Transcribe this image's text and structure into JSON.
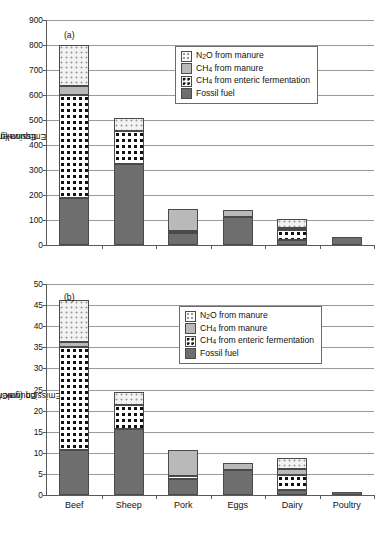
{
  "figure": {
    "panel_a_tag": "(a)",
    "panel_b_tag": "(b)",
    "caption_clipped": ""
  },
  "legend": {
    "items": [
      {
        "key": "n2o",
        "label_prefix": "N",
        "label_sub": "2",
        "label_suffix": "O from manure"
      },
      {
        "key": "manure-ch4",
        "label_prefix": "CH",
        "label_sub": "4",
        "label_suffix": " from manure"
      },
      {
        "key": "enteric",
        "label_prefix": "CH",
        "label_sub": "4",
        "label_suffix": " from enteric fermentation"
      },
      {
        "key": "fossil",
        "label_prefix": "Fossil fuel",
        "label_sub": "",
        "label_suffix": ""
      }
    ]
  },
  "chart_data": [
    {
      "type": "bar",
      "id": "panel-a",
      "title": "(a)",
      "stacked": true,
      "categories": [
        "Beef",
        "Sheep",
        "Pork",
        "Eggs",
        "Dairy",
        "Poultry"
      ],
      "series": [
        {
          "name": "Fossil fuel",
          "values": [
            190,
            325,
            48,
            112,
            20,
            33
          ]
        },
        {
          "name": "CH4 from enteric fermentation",
          "values": [
            410,
            130,
            10,
            0,
            40,
            0
          ]
        },
        {
          "name": "CH4 from manure",
          "values": [
            35,
            0,
            87,
            30,
            10,
            0
          ]
        },
        {
          "name": "N2O from manure",
          "values": [
            165,
            55,
            0,
            0,
            35,
            0
          ]
        }
      ],
      "totals": [
        800,
        510,
        145,
        142,
        105,
        33
      ],
      "xlabel": "",
      "ylabel": "Equivalent CO2 Emission (gmC/MJ)",
      "ylim": [
        0,
        900
      ],
      "ytick_step": 100,
      "yticks": [
        0,
        100,
        200,
        300,
        400,
        500,
        600,
        700,
        800,
        900
      ],
      "grid": true,
      "legend_position": "upper-center"
    },
    {
      "type": "bar",
      "id": "panel-b",
      "title": "(b)",
      "stacked": true,
      "categories": [
        "Beef",
        "Sheep",
        "Pork",
        "Eggs",
        "Dairy",
        "Poultry"
      ],
      "series": [
        {
          "name": "Fossil fuel",
          "values": [
            10.7,
            15.6,
            3.8,
            6.0,
            1.2,
            0.8
          ]
        },
        {
          "name": "CH4 from enteric fermentation",
          "values": [
            24.3,
            5.7,
            0.7,
            0.0,
            3.5,
            0.0
          ]
        },
        {
          "name": "CH4 from manure",
          "values": [
            1.2,
            0.0,
            6.2,
            1.5,
            1.4,
            0.0
          ]
        },
        {
          "name": "N2O from manure",
          "values": [
            10.1,
            3.2,
            0.0,
            0.0,
            2.6,
            0.0
          ]
        }
      ],
      "totals": [
        46.3,
        24.5,
        10.7,
        7.5,
        8.7,
        0.8
      ],
      "xlabel": "",
      "ylabel": "Equivalent CO2 Emission (gmC/gm protein)",
      "ylim": [
        0,
        50
      ],
      "ytick_step": 5,
      "yticks": [
        0,
        5,
        10,
        15,
        20,
        25,
        30,
        35,
        40,
        45,
        50
      ],
      "grid": true,
      "legend_position": "upper-center"
    }
  ],
  "axis_labels": {
    "panel_a_y_prefix": "Equivalent CO",
    "panel_a_y_sub": "2",
    "panel_a_y_suffix": " Emission (gmC/MJ)",
    "panel_b_y_prefix": "Equivalent CO",
    "panel_b_y_sub": "2",
    "panel_b_y_suffix": " Emission (gmC/gm protein)"
  }
}
